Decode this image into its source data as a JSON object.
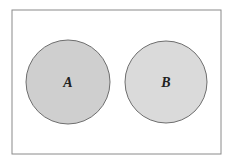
{
  "diagram": {
    "type": "venn",
    "universe": {
      "x": 12,
      "y": 10,
      "w": 209,
      "h": 144,
      "stroke": "#8a8a8a",
      "fill": "#ffffff"
    },
    "sets": [
      {
        "label": "A",
        "cx": 68,
        "cy": 82,
        "r": 42,
        "fill": "#cfcfcf",
        "stroke": "#6e6e6e"
      },
      {
        "label": "B",
        "cx": 166,
        "cy": 82,
        "r": 41,
        "fill": "#dadada",
        "stroke": "#6e6e6e"
      }
    ],
    "relationship": "disjoint"
  }
}
